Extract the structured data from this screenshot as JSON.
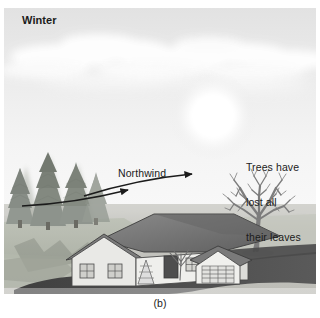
{
  "figure": {
    "caption": "(b)",
    "season_label": "Winter",
    "wind_label": "Northwind",
    "trees_note_lines": [
      "Trees have",
      "lost all",
      "their leaves"
    ],
    "trees_note": "Trees have lost all their leaves"
  },
  "colors": {
    "sky_top": "#e3e3e3",
    "sky_bottom": "#f7f7f7",
    "sun": "#ffffff",
    "cloud": "#fbfbfb",
    "ground": "#c9c9c4",
    "grass": "#b9bdb2",
    "conifer": "#9a9f96",
    "bare_tree": "#8d8d8d",
    "roof": "#6e6e6e",
    "wall": "#e8e8e6",
    "driveway": "#4a4a4a",
    "arrow": "#1b1b1b",
    "text": "#1b1b1b"
  },
  "elements": {
    "sun_name": "sun",
    "clouds_name": "cloud-band",
    "conifers_name": "conifer-trees",
    "bare_tree_name": "bare-deciduous-tree",
    "house_name": "house",
    "garage_name": "garage",
    "driveway_name": "driveway",
    "wind_arrow_upper": "wind-arrow-upper",
    "wind_arrow_lower": "wind-arrow-lower"
  }
}
